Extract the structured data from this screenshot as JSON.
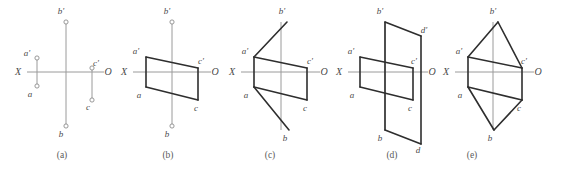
{
  "figure": {
    "width": 561,
    "height": 171,
    "background": "#ffffff",
    "axis_color": "#9a9a9a",
    "edge_color": "#2e2e2e",
    "label_color": "#4a4a4a",
    "caption_color": "#5a5a5a"
  },
  "chart_data": {
    "type": "diagram",
    "title": "",
    "panels": [
      {
        "id": "a",
        "caption": "(a)",
        "caption_x": 62,
        "caption_y": 158,
        "axis": {
          "x_label": "X",
          "o_label": "O",
          "x_label_x": 18,
          "x_label_y": 75,
          "o_label_x": 108,
          "o_label_y": 75,
          "h_line": [
            27,
            72,
            104,
            72
          ],
          "v_line": [
            66,
            22,
            66,
            126
          ]
        },
        "points": [
          {
            "name": "a'",
            "x": 37,
            "y": 58,
            "label_x": 27,
            "label_y": 56,
            "marker": true
          },
          {
            "name": "a",
            "x": 37,
            "y": 86,
            "label_x": 30,
            "label_y": 97,
            "marker": true
          },
          {
            "name": "b'",
            "x": 66,
            "y": 22,
            "label_x": 61,
            "label_y": 14,
            "marker": true
          },
          {
            "name": "b",
            "x": 66,
            "y": 126,
            "label_x": 61,
            "label_y": 137,
            "marker": true
          },
          {
            "name": "c'",
            "x": 92,
            "y": 68,
            "label_x": 96,
            "label_y": 66,
            "marker": true
          },
          {
            "name": "c",
            "x": 92,
            "y": 100,
            "label_x": 88,
            "label_y": 110,
            "marker": true
          }
        ],
        "connectors": [
          [
            37,
            58,
            37,
            86
          ],
          [
            92,
            68,
            92,
            100
          ]
        ],
        "edges": []
      },
      {
        "id": "b",
        "caption": "(b)",
        "caption_x": 168,
        "caption_y": 158,
        "axis": {
          "x_label": "X",
          "o_label": "O",
          "x_label_x": 124,
          "x_label_y": 75,
          "o_label_x": 215,
          "o_label_y": 75,
          "h_line": [
            133,
            72,
            211,
            72
          ],
          "v_line": [
            172,
            22,
            172,
            126
          ]
        },
        "points": [
          {
            "name": "a'",
            "x": 146,
            "y": 57,
            "label_x": 136,
            "label_y": 54,
            "marker": false
          },
          {
            "name": "a",
            "x": 146,
            "y": 87,
            "label_x": 139,
            "label_y": 98,
            "marker": false
          },
          {
            "name": "b'",
            "x": 172,
            "y": 22,
            "label_x": 167,
            "label_y": 14,
            "marker": true
          },
          {
            "name": "b",
            "x": 172,
            "y": 126,
            "label_x": 167,
            "label_y": 137,
            "marker": true
          },
          {
            "name": "c'",
            "x": 198,
            "y": 68,
            "label_x": 201,
            "label_y": 64,
            "marker": false
          },
          {
            "name": "c",
            "x": 198,
            "y": 100,
            "label_x": 196,
            "label_y": 111,
            "marker": false
          }
        ],
        "connectors": [],
        "edges": [
          [
            146,
            57,
            198,
            68
          ],
          [
            146,
            87,
            198,
            100
          ],
          [
            146,
            57,
            146,
            87
          ],
          [
            198,
            68,
            198,
            100
          ]
        ]
      },
      {
        "id": "c",
        "caption": "(c)",
        "caption_x": 270,
        "caption_y": 158,
        "axis": {
          "x_label": "X",
          "o_label": "O",
          "x_label_x": 232,
          "x_label_y": 75,
          "o_label_x": 324,
          "o_label_y": 75,
          "h_line": [
            241,
            72,
            320,
            72
          ],
          "v_line": [
            281,
            22,
            281,
            130
          ]
        },
        "points": [
          {
            "name": "a'",
            "x": 254,
            "y": 57,
            "label_x": 245,
            "label_y": 54,
            "marker": false
          },
          {
            "name": "a",
            "x": 254,
            "y": 87,
            "label_x": 246,
            "label_y": 98,
            "marker": false
          },
          {
            "name": "b'",
            "x": 287,
            "y": 22,
            "label_x": 282,
            "label_y": 14,
            "marker": false
          },
          {
            "name": "b",
            "x": 289,
            "y": 130,
            "label_x": 285,
            "label_y": 141,
            "marker": false
          },
          {
            "name": "c'",
            "x": 307,
            "y": 68,
            "label_x": 310,
            "label_y": 64,
            "marker": false
          },
          {
            "name": "c",
            "x": 307,
            "y": 100,
            "label_x": 305,
            "label_y": 111,
            "marker": false
          }
        ],
        "connectors": [],
        "edges": [
          [
            254,
            57,
            307,
            68
          ],
          [
            254,
            87,
            307,
            100
          ],
          [
            254,
            57,
            254,
            87
          ],
          [
            307,
            68,
            307,
            100
          ],
          [
            254,
            57,
            287,
            22
          ],
          [
            254,
            87,
            289,
            130
          ]
        ]
      },
      {
        "id": "d",
        "caption": "(d)",
        "caption_x": 392,
        "caption_y": 158,
        "axis": {
          "x_label": "X",
          "o_label": "O",
          "x_label_x": 339,
          "x_label_y": 75,
          "o_label_x": 432,
          "o_label_y": 75,
          "h_line": [
            348,
            72,
            428,
            72
          ],
          "v_line": [
            385,
            22,
            385,
            130
          ]
        },
        "points": [
          {
            "name": "a'",
            "x": 360,
            "y": 57,
            "label_x": 351,
            "label_y": 54,
            "marker": false
          },
          {
            "name": "a",
            "x": 360,
            "y": 87,
            "label_x": 352,
            "label_y": 98,
            "marker": false
          },
          {
            "name": "b'",
            "x": 385,
            "y": 22,
            "label_x": 380,
            "label_y": 14,
            "marker": false
          },
          {
            "name": "b",
            "x": 385,
            "y": 130,
            "label_x": 380,
            "label_y": 141,
            "marker": false
          },
          {
            "name": "c'",
            "x": 413,
            "y": 68,
            "label_x": 414,
            "label_y": 64,
            "marker": false
          },
          {
            "name": "c",
            "x": 413,
            "y": 100,
            "label_x": 410,
            "label_y": 111,
            "marker": false
          },
          {
            "name": "d'",
            "x": 421,
            "y": 36,
            "label_x": 424,
            "label_y": 33,
            "marker": false
          },
          {
            "name": "d",
            "x": 421,
            "y": 144,
            "label_x": 418,
            "label_y": 153,
            "marker": false
          }
        ],
        "connectors": [],
        "edges": [
          [
            360,
            57,
            413,
            68
          ],
          [
            360,
            87,
            413,
            100
          ],
          [
            360,
            57,
            360,
            87
          ],
          [
            413,
            68,
            413,
            100
          ],
          [
            385,
            22,
            421,
            36
          ],
          [
            421,
            36,
            421,
            144
          ],
          [
            385,
            130,
            421,
            144
          ],
          [
            385,
            22,
            385,
            130
          ]
        ]
      },
      {
        "id": "e",
        "caption": "(e)",
        "caption_x": 472,
        "caption_y": 158,
        "axis": {
          "x_label": "X",
          "o_label": "O",
          "x_label_x": 446,
          "x_label_y": 75,
          "o_label_x": 538,
          "o_label_y": 75,
          "h_line": [
            455,
            72,
            534,
            72
          ],
          "v_line": [
            493,
            22,
            493,
            130
          ]
        },
        "points": [
          {
            "name": "a'",
            "x": 468,
            "y": 57,
            "label_x": 459,
            "label_y": 54,
            "marker": false
          },
          {
            "name": "a",
            "x": 468,
            "y": 87,
            "label_x": 460,
            "label_y": 98,
            "marker": false
          },
          {
            "name": "b'",
            "x": 498,
            "y": 22,
            "label_x": 493,
            "label_y": 14,
            "marker": false
          },
          {
            "name": "b",
            "x": 494,
            "y": 130,
            "label_x": 490,
            "label_y": 141,
            "marker": false
          },
          {
            "name": "c'",
            "x": 522,
            "y": 68,
            "label_x": 524,
            "label_y": 64,
            "marker": false
          },
          {
            "name": "c",
            "x": 522,
            "y": 100,
            "label_x": 519,
            "label_y": 111,
            "marker": false
          }
        ],
        "connectors": [],
        "edges": [
          [
            468,
            57,
            522,
            68
          ],
          [
            468,
            87,
            522,
            100
          ],
          [
            468,
            57,
            468,
            87
          ],
          [
            522,
            68,
            522,
            100
          ],
          [
            468,
            57,
            498,
            22
          ],
          [
            498,
            22,
            522,
            68
          ],
          [
            468,
            87,
            494,
            130
          ],
          [
            494,
            130,
            522,
            100
          ]
        ]
      }
    ]
  }
}
